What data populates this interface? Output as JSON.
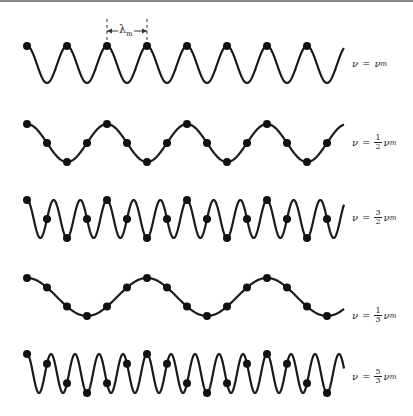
{
  "figure": {
    "x_start": 27,
    "x_end": 344,
    "sample_spacing": 20,
    "base_wavelength_px": 40,
    "line_color": "#1a1a1a",
    "dot_color": "#111111"
  },
  "lambda_marker": {
    "symbol": "λ",
    "subscript": "m",
    "x1": 107,
    "x2": 147,
    "y_top": 19,
    "y_bottom": 42,
    "y_arrow": 31
  },
  "waves": [
    {
      "id": "nu-m",
      "freq_ratio": 1,
      "y_center": 64.5,
      "amplitude": 18.5,
      "samples_every": 40,
      "label": {
        "var": "ν",
        "eq": "=",
        "num": "",
        "den": "",
        "rhs": "ν",
        "sub": "m",
        "top": 58
      }
    },
    {
      "id": "half-nu-m",
      "freq_ratio": 0.5,
      "y_center": 143,
      "amplitude": 19,
      "samples_every": 20,
      "label": {
        "var": "ν",
        "eq": "=",
        "num": "1",
        "den": "2",
        "rhs": "ν",
        "sub": "m",
        "top": 134
      }
    },
    {
      "id": "three-halves-nu-m",
      "freq_ratio": 1.5,
      "y_center": 219,
      "amplitude": 19,
      "samples_every": 20,
      "label": {
        "var": "ν",
        "eq": "=",
        "num": "3",
        "den": "2",
        "rhs": "ν",
        "sub": "m",
        "top": 209
      }
    },
    {
      "id": "third-nu-m",
      "freq_ratio": 0.3333333,
      "y_center": 297,
      "amplitude": 19,
      "samples_every": 20,
      "label": {
        "var": "ν",
        "eq": "=",
        "num": "1",
        "den": "3",
        "rhs": "ν",
        "sub": "m",
        "top": 307
      }
    },
    {
      "id": "five-thirds-nu-m",
      "freq_ratio": 1.6666667,
      "y_center": 373.5,
      "amplitude": 19.5,
      "samples_every": 20,
      "label": {
        "var": "ν",
        "eq": "=",
        "num": "5",
        "den": "3",
        "rhs": "ν",
        "sub": "m",
        "top": 368
      }
    }
  ]
}
